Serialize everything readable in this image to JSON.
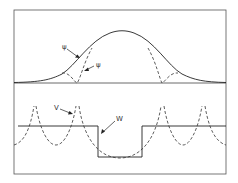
{
  "figure": {
    "upper_panel": {
      "labels": {
        "psi_true": "ψ",
        "psi_pseudo": "ψ"
      }
    },
    "lower_panel": {
      "labels": {
        "v_potential": "V",
        "w_pseudopotential": "W"
      }
    }
  }
}
